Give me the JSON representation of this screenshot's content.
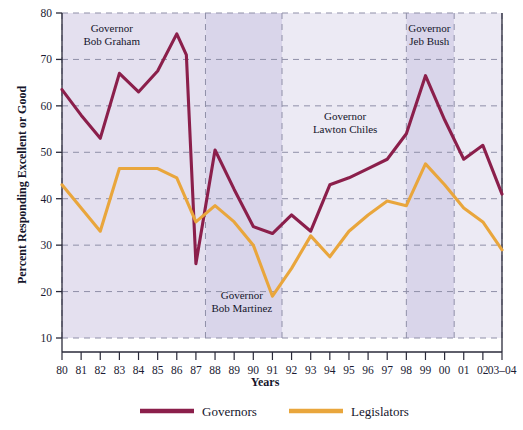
{
  "chart_data": {
    "type": "line",
    "title": "",
    "xlabel": "Years",
    "ylabel": "Percent Responding Excellent or Good",
    "ylim": [
      10,
      80
    ],
    "yticks": [
      10,
      20,
      30,
      40,
      50,
      60,
      70,
      80
    ],
    "grid": true,
    "legend_position": "bottom",
    "categories": [
      "80",
      "81",
      "82",
      "83",
      "84",
      "85",
      "86",
      "87",
      "88",
      "89",
      "90",
      "91",
      "92",
      "93",
      "94",
      "95",
      "96",
      "97",
      "98",
      "99",
      "00",
      "01",
      "02",
      "03–04"
    ],
    "xtick_labels": [
      "80",
      "81",
      "82",
      "83",
      "84",
      "85",
      "86",
      "87",
      "88",
      "89",
      "90",
      "91",
      "92",
      "93",
      "94",
      "95",
      "96",
      "97",
      "98",
      "99",
      "00",
      "01",
      "02",
      "03–04"
    ],
    "series": [
      {
        "name": "Governors",
        "color": "#8B1F4B",
        "values": [
          63.5,
          58.0,
          53.0,
          67.0,
          63.0,
          67.5,
          75.5,
          26.0,
          50.5,
          42.0,
          34.0,
          32.5,
          36.5,
          33.0,
          43.0,
          44.5,
          46.5,
          48.5,
          54.0,
          66.5,
          57.0,
          48.5,
          51.5,
          41.0
        ],
        "extra_points": [
          {
            "x_label": "86.5",
            "x_frac": 6.5,
            "value": 71.0,
            "note": "mid-year point before sharp 1987 drop"
          }
        ]
      },
      {
        "name": "Legislators",
        "color": "#E9A63C",
        "values": [
          43.0,
          38.0,
          33.0,
          46.5,
          46.5,
          46.5,
          44.5,
          35.0,
          38.5,
          35.0,
          30.0,
          19.0,
          25.0,
          32.0,
          27.5,
          33.0,
          36.5,
          39.5,
          38.5,
          47.5,
          43.0,
          38.0,
          35.0,
          29.0
        ]
      }
    ],
    "annotations": [
      {
        "id": "graham",
        "lines": [
          "Governor",
          "Bob Graham"
        ],
        "x_start_frac": 0.0,
        "x_end_frac": 7.5,
        "label_x_frac": 2.6,
        "label_y": 76.0
      },
      {
        "id": "martinez",
        "lines": [
          "Governor",
          "Bob Martinez"
        ],
        "x_start_frac": 7.5,
        "x_end_frac": 11.5,
        "label_x_frac": 9.4,
        "label_y": 18.5
      },
      {
        "id": "chiles",
        "lines": [
          "Governor",
          "Lawton Chiles"
        ],
        "x_start_frac": 11.5,
        "x_end_frac": 18.0,
        "label_x_frac": 14.8,
        "label_y": 57.0
      },
      {
        "id": "bush",
        "lines": [
          "Governor",
          "Jeb Bush"
        ],
        "x_start_frac": 18.0,
        "x_end_frac": 20.5,
        "label_x_frac": 19.2,
        "label_y": 76.0
      }
    ],
    "shaded_bands": [
      {
        "id": "graham",
        "x_start_frac": 0.0,
        "x_end_frac": 7.5,
        "color": "#e4e0ef"
      },
      {
        "id": "martinez",
        "x_start_frac": 7.5,
        "x_end_frac": 11.5,
        "color": "#d9d5ea"
      },
      {
        "id": "chiles",
        "x_start_frac": 11.5,
        "x_end_frac": 18.0,
        "color": "#eceaf4"
      },
      {
        "id": "bush",
        "x_start_frac": 18.0,
        "x_end_frac": 20.5,
        "color": "#d9d5ea"
      },
      {
        "id": "post",
        "x_start_frac": 20.5,
        "x_end_frac": 23.0,
        "color": "#eceaf4"
      }
    ]
  },
  "axes": {
    "y_title": "Percent Responding Excellent or Good",
    "x_title": "Years"
  },
  "legend": {
    "entries": [
      {
        "label": "Governors",
        "color": "#8B1F4B"
      },
      {
        "label": "Legislators",
        "color": "#E9A63C"
      }
    ]
  },
  "colors": {
    "governors": "#8B1F4B",
    "legislators": "#E9A63C",
    "band_light": "#eceaf4",
    "band_dark": "#d9d5ea",
    "grid": "#8f8fa8",
    "axis": "#2a2a3a",
    "text": "#15152b",
    "background": "#ffffff"
  }
}
